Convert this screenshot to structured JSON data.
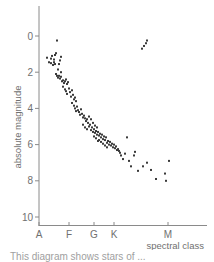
{
  "chart_data": {
    "type": "scatter",
    "title": "",
    "xlabel": "spectral class",
    "ylabel": "absolute magnitude",
    "x_ticks": [
      {
        "label": "A",
        "value": 0
      },
      {
        "label": "F",
        "value": 30
      },
      {
        "label": "G",
        "value": 55
      },
      {
        "label": "K",
        "value": 75
      },
      {
        "label": "M",
        "value": 129
      }
    ],
    "xlim": [
      0,
      168
    ],
    "y_ticks": [
      0,
      2,
      4,
      6,
      8,
      10
    ],
    "ylim": [
      -1.6,
      10.6
    ],
    "y_inverted": true,
    "grid": false,
    "legend": null,
    "series": [
      {
        "name": "main sequence",
        "points": [
          [
            8,
            1.2
          ],
          [
            12,
            1.25
          ],
          [
            13,
            1.1
          ],
          [
            15,
            1.3
          ],
          [
            16,
            1.05
          ],
          [
            17,
            0.95
          ],
          [
            18,
            0.25
          ],
          [
            10,
            1.45
          ],
          [
            12,
            1.5
          ],
          [
            14,
            1.6
          ],
          [
            15,
            1.45
          ],
          [
            16,
            1.55
          ],
          [
            21,
            1.35
          ],
          [
            22,
            1.15
          ],
          [
            20,
            1.55
          ],
          [
            19,
            1.85
          ],
          [
            22,
            2.0
          ],
          [
            17,
            2.1
          ],
          [
            18,
            2.2
          ],
          [
            19,
            2.3
          ],
          [
            20,
            2.2
          ],
          [
            21,
            2.35
          ],
          [
            22,
            2.25
          ],
          [
            23,
            2.5
          ],
          [
            24,
            2.45
          ],
          [
            25,
            2.6
          ],
          [
            26,
            2.5
          ],
          [
            27,
            2.4
          ],
          [
            28,
            2.65
          ],
          [
            29,
            2.55
          ],
          [
            24,
            2.8
          ],
          [
            26,
            2.95
          ],
          [
            27,
            3.05
          ],
          [
            28,
            3.2
          ],
          [
            30,
            2.9
          ],
          [
            31,
            3.1
          ],
          [
            32,
            3.35
          ],
          [
            33,
            3.0
          ],
          [
            34,
            3.25
          ],
          [
            35,
            3.5
          ],
          [
            36,
            3.4
          ],
          [
            37,
            3.6
          ],
          [
            33,
            3.7
          ],
          [
            35,
            3.85
          ],
          [
            36,
            4.0
          ],
          [
            37,
            4.15
          ],
          [
            38,
            3.9
          ],
          [
            39,
            4.1
          ],
          [
            40,
            4.2
          ],
          [
            41,
            4.35
          ],
          [
            42,
            4.05
          ],
          [
            43,
            4.3
          ],
          [
            44,
            4.5
          ],
          [
            45,
            4.4
          ],
          [
            46,
            4.55
          ],
          [
            47,
            4.7
          ],
          [
            48,
            4.6
          ],
          [
            49,
            4.8
          ],
          [
            50,
            4.45
          ],
          [
            51,
            4.9
          ],
          [
            44,
            4.9
          ],
          [
            46,
            5.05
          ],
          [
            48,
            5.15
          ],
          [
            50,
            5.0
          ],
          [
            52,
            5.2
          ],
          [
            53,
            5.05
          ],
          [
            54,
            5.3
          ],
          [
            55,
            5.15
          ],
          [
            56,
            5.35
          ],
          [
            57,
            5.25
          ],
          [
            58,
            5.45
          ],
          [
            59,
            5.3
          ],
          [
            60,
            5.5
          ],
          [
            61,
            5.4
          ],
          [
            62,
            5.6
          ],
          [
            63,
            5.45
          ],
          [
            64,
            5.7
          ],
          [
            65,
            5.55
          ],
          [
            66,
            5.75
          ],
          [
            67,
            5.6
          ],
          [
            68,
            5.9
          ],
          [
            69,
            5.8
          ],
          [
            70,
            6.0
          ],
          [
            71,
            5.85
          ],
          [
            72,
            6.05
          ],
          [
            73,
            5.95
          ],
          [
            74,
            6.15
          ],
          [
            75,
            6.0
          ],
          [
            76,
            6.2
          ],
          [
            77,
            6.1
          ],
          [
            78,
            6.3
          ],
          [
            79,
            6.25
          ],
          [
            80,
            6.35
          ],
          [
            81,
            6.45
          ],
          [
            82,
            6.6
          ],
          [
            84,
            6.8
          ],
          [
            60,
            5.75
          ],
          [
            62,
            5.85
          ],
          [
            64,
            5.95
          ],
          [
            66,
            6.05
          ],
          [
            68,
            6.15
          ],
          [
            55,
            5.55
          ],
          [
            57,
            5.65
          ],
          [
            59,
            5.8
          ],
          [
            52,
            4.6
          ],
          [
            54,
            4.8
          ],
          [
            56,
            4.95
          ],
          [
            58,
            5.05
          ],
          [
            86,
            6.5
          ],
          [
            88,
            5.6
          ],
          [
            90,
            6.9
          ],
          [
            92,
            7.2
          ],
          [
            95,
            6.6
          ],
          [
            96,
            6.4
          ],
          [
            99,
            7.45
          ],
          [
            104,
            7.2
          ],
          [
            108,
            7.0
          ],
          [
            112,
            7.4
          ],
          [
            117,
            7.9
          ],
          [
            126,
            7.6
          ],
          [
            127,
            8.0
          ],
          [
            130,
            6.9
          ]
        ]
      },
      {
        "name": "giants",
        "points": [
          [
            103,
            0.7
          ],
          [
            105,
            0.55
          ],
          [
            107,
            0.4
          ],
          [
            108,
            0.25
          ]
        ]
      }
    ],
    "caption_partial": "This diagram shows stars of ... spectral class"
  },
  "caption": "This diagram shows stars of ..."
}
